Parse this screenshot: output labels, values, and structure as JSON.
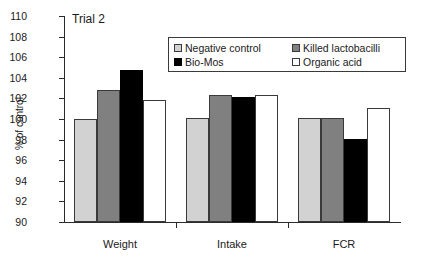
{
  "chart_data": {
    "type": "bar",
    "title": "Trial 2",
    "xlabel": "",
    "ylabel": "% of control",
    "ylim": [
      90,
      110
    ],
    "ytick_step": 2,
    "yticks": [
      90,
      92,
      94,
      96,
      98,
      100,
      102,
      104,
      106,
      108,
      110
    ],
    "grid": false,
    "legend_position": "upper-center",
    "categories": [
      "Weight",
      "Intake",
      "FCR"
    ],
    "series": [
      {
        "name": "Negative control",
        "color": "#d2d2d2",
        "values": [
          100.0,
          100.1,
          100.1
        ]
      },
      {
        "name": "Killed lactobacilli",
        "color": "#808080",
        "values": [
          102.8,
          102.3,
          100.1
        ]
      },
      {
        "name": "Bio-Mos",
        "color": "#000000",
        "values": [
          104.8,
          102.1,
          98.1
        ]
      },
      {
        "name": "Organic acid",
        "color": "#ffffff",
        "values": [
          101.8,
          102.3,
          101.1
        ]
      }
    ]
  },
  "legend": {
    "entries": [
      {
        "label": "Negative control"
      },
      {
        "label": "Killed lactobacilli"
      },
      {
        "label": "Bio-Mos"
      },
      {
        "label": "Organic acid"
      }
    ]
  },
  "axis": {
    "y_title": "% of control",
    "y_tick_labels": [
      "110",
      "108",
      "106",
      "104",
      "102",
      "100",
      "98",
      "96",
      "94",
      "92",
      "90"
    ],
    "x_tick_labels": [
      "Weight",
      "Intake",
      "FCR"
    ]
  }
}
